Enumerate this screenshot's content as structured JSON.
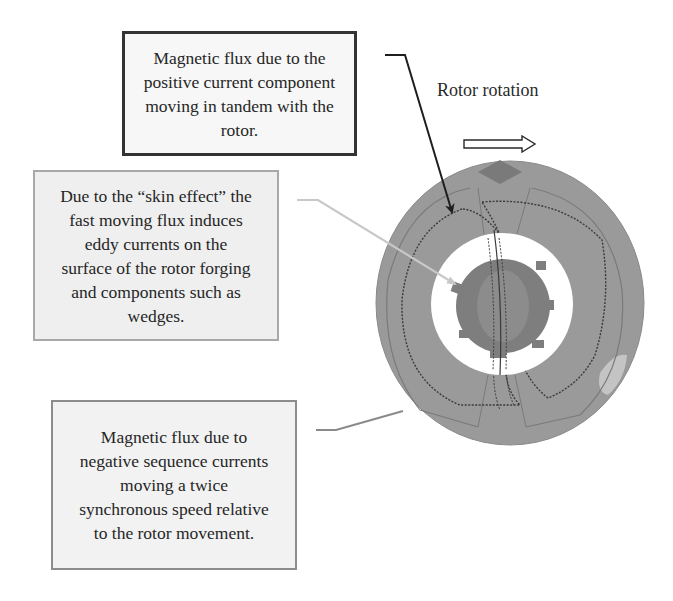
{
  "figure": {
    "callouts": [
      {
        "id": "positive-current",
        "lines": [
          "Magnetic flux due to the",
          "positive current component",
          "moving in tandem with the",
          "rotor."
        ]
      },
      {
        "id": "skin-effect",
        "lines": [
          "Due to the “skin effect” the",
          "fast moving flux induces",
          "eddy currents on the",
          "surface of the rotor forging",
          "and components such as",
          "wedges."
        ]
      },
      {
        "id": "negative-sequence",
        "lines": [
          "Magnetic flux due to",
          "negative sequence currents",
          "moving a twice",
          "synchronous speed relative",
          "to the rotor movement."
        ]
      }
    ],
    "rotation_label": "Rotor rotation",
    "rotation_direction": "right",
    "colors": {
      "stator_fill": "#9a9a9a",
      "rotor_fill": "#7e7e7e",
      "hot_spot_dark": "#7a7a7a",
      "hot_spot_light": "#c4c4c4",
      "flux_line": "#3a3a3a",
      "positive_arrow": "#1e1e1e",
      "skin_leader": "#c8c8c8",
      "negative_leader": "#8a8a8a"
    }
  }
}
